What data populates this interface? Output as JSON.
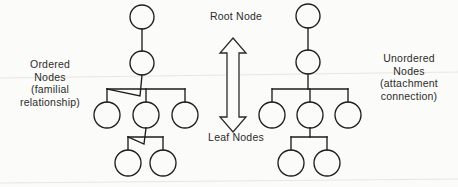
{
  "figure": {
    "background_color": "#fbfbf9",
    "ink_color": "#1d1d1d",
    "text_color": "#2b2b2b"
  },
  "labels": {
    "ordered": "Ordered\nNodes\n(familial\nrelationship)",
    "unordered": "Unordered\nNodes\n(attachment\nconnection)",
    "root": "Root Node",
    "leaf": "Leaf Nodes"
  },
  "annotations": {
    "double_arrow": {
      "icon": "double-headed-vertical-arrow",
      "direction": "up-down",
      "x": 233,
      "y_top": 38,
      "y_bottom": 132
    }
  },
  "chart_data": {
    "type": "diagram",
    "trees": [
      {
        "name": "ordered-tree",
        "label": "Ordered Nodes (familial relationship)",
        "connector_style": "slanted",
        "nodes": [
          {
            "id": "L-root",
            "level": 0,
            "cx": 142,
            "cy": 17,
            "r": 12,
            "role": "root"
          },
          {
            "id": "L-n1",
            "level": 1,
            "cx": 142,
            "cy": 63,
            "r": 12,
            "role": "internal"
          },
          {
            "id": "L-c1",
            "level": 2,
            "cx": 107,
            "cy": 115,
            "r": 13,
            "role": "leaf"
          },
          {
            "id": "L-c2",
            "level": 2,
            "cx": 146,
            "cy": 115,
            "r": 13,
            "role": "internal"
          },
          {
            "id": "L-c3",
            "level": 2,
            "cx": 185,
            "cy": 115,
            "r": 13,
            "role": "leaf"
          },
          {
            "id": "L-g1",
            "level": 3,
            "cx": 128,
            "cy": 163,
            "r": 13,
            "role": "leaf"
          },
          {
            "id": "L-g2",
            "level": 3,
            "cx": 163,
            "cy": 163,
            "r": 13,
            "role": "leaf"
          }
        ],
        "edges": [
          {
            "from": "L-root",
            "to": "L-n1"
          },
          {
            "from": "L-n1",
            "to": "L-c1"
          },
          {
            "from": "L-n1",
            "to": "L-c2"
          },
          {
            "from": "L-n1",
            "to": "L-c3"
          },
          {
            "from": "L-c2",
            "to": "L-g1"
          },
          {
            "from": "L-c2",
            "to": "L-g2"
          }
        ]
      },
      {
        "name": "unordered-tree",
        "label": "Unordered Nodes (attachment connection)",
        "connector_style": "orthogonal",
        "nodes": [
          {
            "id": "R-root",
            "level": 0,
            "cx": 308,
            "cy": 16,
            "r": 12,
            "role": "root"
          },
          {
            "id": "R-n1",
            "level": 1,
            "cx": 308,
            "cy": 62,
            "r": 12,
            "role": "internal"
          },
          {
            "id": "R-c1",
            "level": 2,
            "cx": 272,
            "cy": 115,
            "r": 13,
            "role": "leaf"
          },
          {
            "id": "R-c2",
            "level": 2,
            "cx": 310,
            "cy": 115,
            "r": 13,
            "role": "internal"
          },
          {
            "id": "R-c3",
            "level": 2,
            "cx": 348,
            "cy": 115,
            "r": 13,
            "role": "leaf"
          },
          {
            "id": "R-g1",
            "level": 3,
            "cx": 291,
            "cy": 163,
            "r": 13,
            "role": "leaf"
          },
          {
            "id": "R-g2",
            "level": 3,
            "cx": 327,
            "cy": 163,
            "r": 13,
            "role": "leaf"
          }
        ],
        "edges": [
          {
            "from": "R-root",
            "to": "R-n1"
          },
          {
            "from": "R-n1",
            "to": "R-c1"
          },
          {
            "from": "R-n1",
            "to": "R-c2"
          },
          {
            "from": "R-n1",
            "to": "R-c3"
          },
          {
            "from": "R-c2",
            "to": "R-g1"
          },
          {
            "from": "R-c2",
            "to": "R-g2"
          }
        ]
      }
    ]
  }
}
